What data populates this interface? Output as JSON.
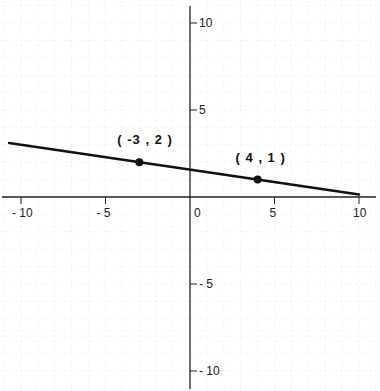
{
  "chart_data": {
    "type": "line",
    "title": "",
    "xlabel": "",
    "ylabel": "",
    "xlim": [
      -11,
      11
    ],
    "ylim": [
      -11,
      11
    ],
    "grid": true,
    "x_ticks": [
      -10,
      -5,
      0,
      5,
      10
    ],
    "y_ticks": [
      10,
      5,
      -5,
      -10
    ],
    "x_tick_labels": [
      "- 10",
      "- 5",
      "0",
      "5",
      "10"
    ],
    "y_tick_labels": [
      "10",
      "5",
      "- 5",
      "- 10"
    ],
    "series": [
      {
        "name": "line",
        "equation": "y = -x/7 + 11/7",
        "x": [
          -10.7,
          10
        ],
        "y": [
          3.1,
          0.14
        ]
      }
    ],
    "points": [
      {
        "x": -3,
        "y": 2,
        "label": "( -3 , 2 )"
      },
      {
        "x": 4,
        "y": 1,
        "label": "( 4 , 1 )"
      }
    ],
    "colors": {
      "line": "#111111",
      "axis": "#222222",
      "grid": "#e6e6e6"
    }
  }
}
